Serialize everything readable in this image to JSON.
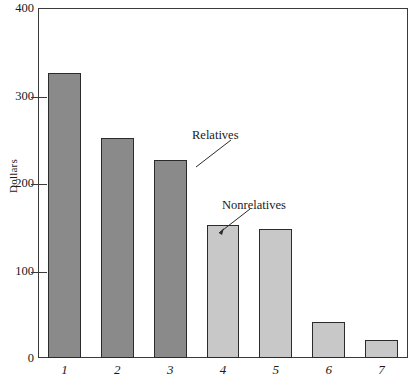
{
  "chart_data": {
    "type": "bar",
    "title": "",
    "xlabel": "",
    "ylabel": "Dollars",
    "categories": [
      "1",
      "2",
      "3",
      "4",
      "5",
      "6",
      "7"
    ],
    "values": [
      326,
      251,
      226,
      152,
      148,
      41,
      21
    ],
    "ylim": [
      0,
      400
    ],
    "yticks": [
      0,
      100,
      200,
      300,
      400
    ],
    "ytick_labels": [
      "0",
      "100",
      "200",
      "300",
      "400"
    ],
    "grid": false,
    "legend_position": "none",
    "groups": [
      {
        "name": "Relatives",
        "categories": [
          "1",
          "2",
          "3"
        ],
        "color": "#8a8a8a"
      },
      {
        "name": "Nonrelatives",
        "categories": [
          "4",
          "5",
          "6",
          "7"
        ],
        "color": "#c8c8c8"
      }
    ],
    "bar_colors": [
      "#8a8a8a",
      "#8a8a8a",
      "#8a8a8a",
      "#c8c8c8",
      "#c8c8c8",
      "#c8c8c8",
      "#c8c8c8"
    ],
    "annotations": [
      {
        "text": "Relatives",
        "points_to_category": "3"
      },
      {
        "text": "Nonrelatives",
        "points_to_category": "4"
      }
    ]
  },
  "axis": {
    "y_label": "Dollars",
    "y_tick_0": "0",
    "y_tick_100": "100",
    "y_tick_200": "200",
    "y_tick_300": "300",
    "y_tick_400": "400",
    "x_tick_1": "1",
    "x_tick_2": "2",
    "x_tick_3": "3",
    "x_tick_4": "4",
    "x_tick_5": "5",
    "x_tick_6": "6",
    "x_tick_7": "7"
  },
  "annotations": {
    "relatives": "Relatives",
    "nonrelatives": "Nonrelatives"
  },
  "colors": {
    "dark_bar": "#8a8a8a",
    "light_bar": "#c8c8c8",
    "bar_outline": "#2b2b2b",
    "frame": "#3a3a3a",
    "background": "#ffffff",
    "text": "#1a1a1a"
  }
}
